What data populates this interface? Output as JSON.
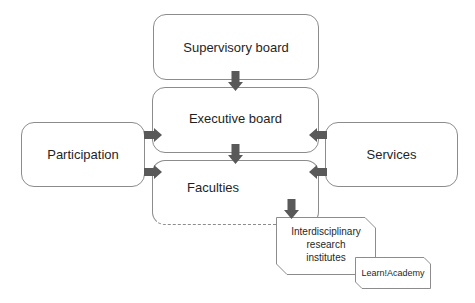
{
  "diagram": {
    "type": "organizational-chart",
    "nodes": {
      "supervisory": {
        "label": "Supervisory board"
      },
      "executive": {
        "label": "Executive board"
      },
      "faculties": {
        "label": "Faculties"
      },
      "participation": {
        "label": "Participation"
      },
      "services": {
        "label": "Services"
      },
      "institutes": {
        "label_lines": [
          "Interdisciplinary",
          "research",
          "institutes"
        ]
      },
      "academy": {
        "label": "Learn!Academy"
      }
    },
    "edges": [
      {
        "from": "supervisory",
        "to": "executive"
      },
      {
        "from": "executive",
        "to": "faculties"
      },
      {
        "from": "participation",
        "to": "executive"
      },
      {
        "from": "participation",
        "to": "faculties"
      },
      {
        "from": "services",
        "to": "executive"
      },
      {
        "from": "services",
        "to": "faculties"
      },
      {
        "from": "faculties",
        "to": "institutes"
      }
    ],
    "colors": {
      "border": "#8c8c8c",
      "arrow": "#595959",
      "text": "#1f1f1f"
    }
  }
}
